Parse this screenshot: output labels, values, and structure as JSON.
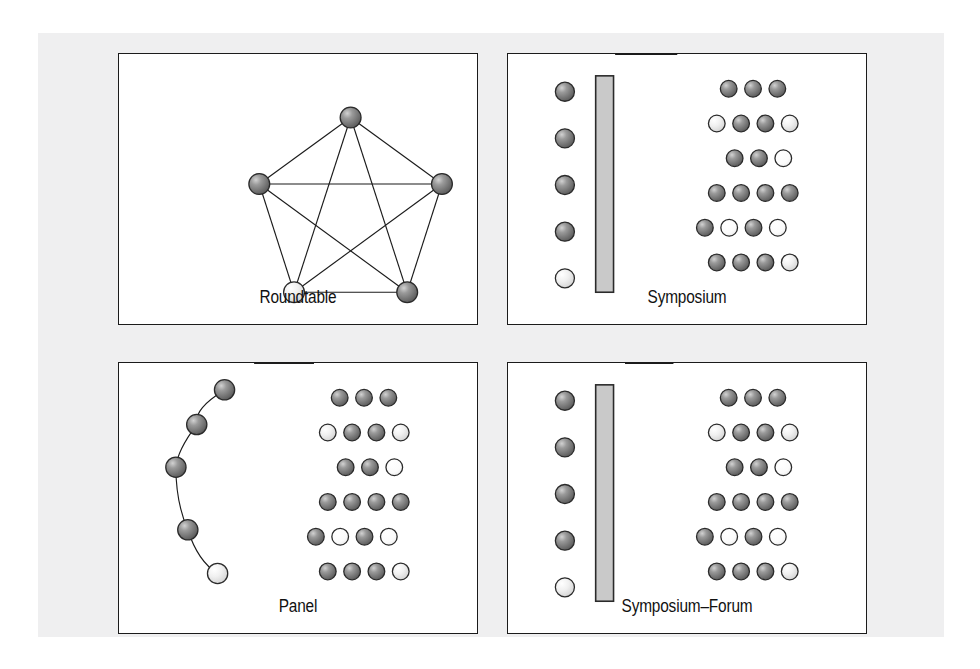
{
  "figure": {
    "background_color": "#ffffff",
    "plate_color": "#efeff0",
    "border_color": "#1b1b1b",
    "sphere_dark_color": "#6e6e6e",
    "sphere_light_color": "#f2f2f2",
    "bar_color": "#c9c9c9",
    "line_color": "#1b1b1b"
  },
  "panels": {
    "roundtable": {
      "caption": "Roundtable",
      "graph_type": "complete-graph-k5",
      "nodes": [
        {
          "id": "n1",
          "x": 170,
          "y": 34,
          "shade": "dark"
        },
        {
          "id": "n2",
          "x": 262,
          "y": 101,
          "shade": "dark"
        },
        {
          "id": "n3",
          "x": 227,
          "y": 210,
          "shade": "dark"
        },
        {
          "id": "n4",
          "x": 113,
          "y": 210,
          "shade": "light"
        },
        {
          "id": "n5",
          "x": 78,
          "y": 101,
          "shade": "dark"
        }
      ],
      "edges": [
        [
          "n1",
          "n2"
        ],
        [
          "n2",
          "n3"
        ],
        [
          "n3",
          "n4"
        ],
        [
          "n4",
          "n5"
        ],
        [
          "n5",
          "n1"
        ],
        [
          "n1",
          "n3"
        ],
        [
          "n1",
          "n4"
        ],
        [
          "n2",
          "n4"
        ],
        [
          "n2",
          "n5"
        ],
        [
          "n3",
          "n5"
        ]
      ]
    },
    "symposium": {
      "caption": "Symposium",
      "arrow_direction": "right",
      "speakers": [
        {
          "x": 57,
          "y": 38,
          "shade": "dark"
        },
        {
          "x": 57,
          "y": 85,
          "shade": "dark"
        },
        {
          "x": 57,
          "y": 132,
          "shade": "dark"
        },
        {
          "x": 57,
          "y": 179,
          "shade": "dark"
        },
        {
          "x": 57,
          "y": 226,
          "shade": "light"
        }
      ],
      "podium_bar": {
        "x": 88,
        "y": 22,
        "width": 18,
        "height": 218
      },
      "arrows": [
        {
          "x1": 108,
          "y": 44,
          "x2": 176
        },
        {
          "x1": 108,
          "y": 90,
          "x2": 176
        },
        {
          "x1": 108,
          "y": 136,
          "x2": 176
        },
        {
          "x1": 108,
          "y": 182,
          "x2": 176
        },
        {
          "x1": 108,
          "y": 228,
          "x2": 176
        }
      ],
      "audience_rows": [
        {
          "x": 222,
          "y": 35,
          "shades": [
            "dark",
            "dark",
            "dark"
          ]
        },
        {
          "x": 210,
          "y": 70,
          "shades": [
            "light",
            "dark",
            "dark",
            "light"
          ]
        },
        {
          "x": 228,
          "y": 105,
          "shades": [
            "dark",
            "dark",
            "white"
          ]
        },
        {
          "x": 210,
          "y": 140,
          "shades": [
            "dark",
            "dark",
            "dark",
            "dark"
          ]
        },
        {
          "x": 198,
          "y": 175,
          "shades": [
            "dark",
            "white",
            "dark",
            "white"
          ]
        },
        {
          "x": 210,
          "y": 210,
          "shades": [
            "dark",
            "dark",
            "dark",
            "light"
          ]
        }
      ]
    },
    "panel": {
      "caption": "Panel",
      "arrow_direction": "left",
      "panelists": [
        {
          "x": 106,
          "y": 27,
          "shade": "dark"
        },
        {
          "x": 78,
          "y": 62,
          "shade": "dark"
        },
        {
          "x": 57,
          "y": 105,
          "shade": "dark"
        },
        {
          "x": 69,
          "y": 168,
          "shade": "dark"
        },
        {
          "x": 99,
          "y": 212,
          "shade": "light"
        }
      ],
      "arc_path": "M 106 27 C 86 40 76 50 78 62 C 66 78 58 92 57 105 C 57 130 62 152 69 168 C 76 190 86 204 99 212",
      "arrows": [
        {
          "x1": 196,
          "y": 68,
          "x2": 130
        },
        {
          "x1": 196,
          "y": 115,
          "x2": 130
        },
        {
          "x1": 196,
          "y": 163,
          "x2": 130
        }
      ],
      "audience_rows": [
        {
          "x": 222,
          "y": 35,
          "shades": [
            "dark",
            "dark",
            "dark"
          ]
        },
        {
          "x": 210,
          "y": 70,
          "shades": [
            "light",
            "dark",
            "dark",
            "light"
          ]
        },
        {
          "x": 228,
          "y": 105,
          "shades": [
            "dark",
            "dark",
            "white"
          ]
        },
        {
          "x": 210,
          "y": 140,
          "shades": [
            "dark",
            "dark",
            "dark",
            "dark"
          ]
        },
        {
          "x": 198,
          "y": 175,
          "shades": [
            "dark",
            "white",
            "dark",
            "white"
          ]
        },
        {
          "x": 210,
          "y": 210,
          "shades": [
            "dark",
            "dark",
            "dark",
            "light"
          ]
        }
      ]
    },
    "symposium_forum": {
      "caption": "Symposium–Forum",
      "arrow_direction": "both",
      "speakers": [
        {
          "x": 57,
          "y": 38,
          "shade": "dark"
        },
        {
          "x": 57,
          "y": 85,
          "shade": "dark"
        },
        {
          "x": 57,
          "y": 132,
          "shade": "dark"
        },
        {
          "x": 57,
          "y": 179,
          "shade": "dark"
        },
        {
          "x": 57,
          "y": 226,
          "shade": "light"
        }
      ],
      "podium_bar": {
        "x": 88,
        "y": 22,
        "width": 18,
        "height": 218
      },
      "arrows": [
        {
          "x1": 112,
          "y": 40,
          "x2": 172
        },
        {
          "x1": 112,
          "y": 86,
          "x2": 172
        },
        {
          "x1": 112,
          "y": 132,
          "x2": 172
        },
        {
          "x1": 112,
          "y": 178,
          "x2": 172
        },
        {
          "x1": 112,
          "y": 224,
          "x2": 172
        }
      ],
      "audience_rows": [
        {
          "x": 222,
          "y": 35,
          "shades": [
            "dark",
            "dark",
            "dark"
          ]
        },
        {
          "x": 210,
          "y": 70,
          "shades": [
            "light",
            "dark",
            "dark",
            "light"
          ]
        },
        {
          "x": 228,
          "y": 105,
          "shades": [
            "dark",
            "dark",
            "white"
          ]
        },
        {
          "x": 210,
          "y": 140,
          "shades": [
            "dark",
            "dark",
            "dark",
            "dark"
          ]
        },
        {
          "x": 198,
          "y": 175,
          "shades": [
            "dark",
            "white",
            "dark",
            "white"
          ]
        },
        {
          "x": 210,
          "y": 210,
          "shades": [
            "dark",
            "dark",
            "dark",
            "light"
          ]
        }
      ]
    }
  }
}
